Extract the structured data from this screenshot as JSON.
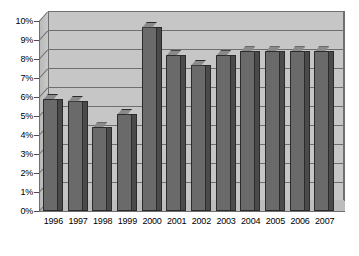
{
  "chart_data": {
    "type": "bar",
    "title": "",
    "subtitle": "",
    "xlabel": "",
    "ylabel": "",
    "categories": [
      "1996",
      "1997",
      "1998",
      "1999",
      "2000",
      "2001",
      "2002",
      "2003",
      "2004",
      "2005",
      "2006",
      "2007"
    ],
    "values": [
      5.9,
      5.8,
      4.4,
      5.1,
      9.7,
      8.2,
      7.7,
      8.2,
      8.4,
      8.4,
      8.4,
      8.4
    ],
    "ylim": [
      0,
      10
    ],
    "ytick_step": 1,
    "ytick_labels": [
      "0%",
      "1%",
      "2%",
      "3%",
      "4%",
      "5%",
      "6%",
      "7%",
      "8%",
      "9%",
      "10%"
    ],
    "ytick_values": [
      0,
      1,
      2,
      3,
      4,
      5,
      6,
      7,
      8,
      9,
      10
    ],
    "value_format": "percent",
    "grid": true,
    "grid_axis": "y",
    "legend": false,
    "legend_position": "none",
    "style": "3d-column",
    "series": [
      {
        "name": "Series 1",
        "values": [
          5.9,
          5.8,
          4.4,
          5.1,
          9.7,
          8.2,
          7.7,
          8.2,
          8.4,
          8.4,
          8.4,
          8.4
        ]
      }
    ]
  },
  "colors": {
    "bar_face": "#6a6a6a",
    "bar_side": "#4a4a4a",
    "bar_top": "#8a8a8a",
    "bar_outline": "#2b2b2b",
    "plot_background": "#c6c6c6",
    "wall_side": "#bdbdbd",
    "gridline": "#6f6f6f",
    "axis_text": "#000000",
    "page_background": "#ffffff"
  }
}
